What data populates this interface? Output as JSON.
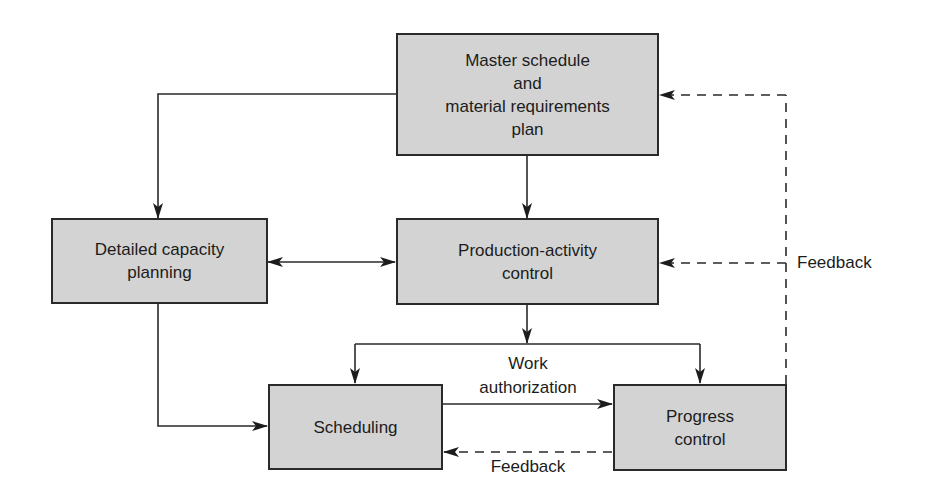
{
  "diagram": {
    "title": "",
    "nodes": {
      "master": {
        "lines": [
          "Master schedule",
          "and",
          "material requirements",
          "plan"
        ]
      },
      "capacity": {
        "lines": [
          "Detailed capacity",
          "planning"
        ]
      },
      "production": {
        "lines": [
          "Production-activity",
          "control"
        ]
      },
      "scheduling": {
        "lines": [
          "Scheduling"
        ]
      },
      "progress": {
        "lines": [
          "Progress",
          "control"
        ]
      }
    },
    "edge_labels": {
      "work_authorization": [
        "Work",
        "authorization"
      ],
      "feedback_to_scheduling": "Feedback",
      "feedback_to_top": "Feedback"
    },
    "edges": [
      {
        "from": "master",
        "to": "capacity",
        "style": "solid"
      },
      {
        "from": "master",
        "to": "production",
        "style": "solid"
      },
      {
        "from": "capacity",
        "to": "production",
        "style": "solid",
        "bidirectional": true
      },
      {
        "from": "capacity",
        "to": "scheduling",
        "style": "solid"
      },
      {
        "from": "production",
        "to": "scheduling",
        "style": "solid"
      },
      {
        "from": "production",
        "to": "progress",
        "style": "solid"
      },
      {
        "from": "scheduling",
        "to": "progress",
        "style": "solid",
        "label": "Work authorization"
      },
      {
        "from": "progress",
        "to": "scheduling",
        "style": "dashed",
        "label": "Feedback"
      },
      {
        "from": "progress",
        "to": "production",
        "style": "dashed",
        "label": "Feedback"
      },
      {
        "from": "progress",
        "to": "master",
        "style": "dashed",
        "label": "Feedback"
      }
    ],
    "colors": {
      "box_fill": "#d3d3d3",
      "stroke": "#2a2a2a",
      "background": "#ffffff"
    }
  }
}
